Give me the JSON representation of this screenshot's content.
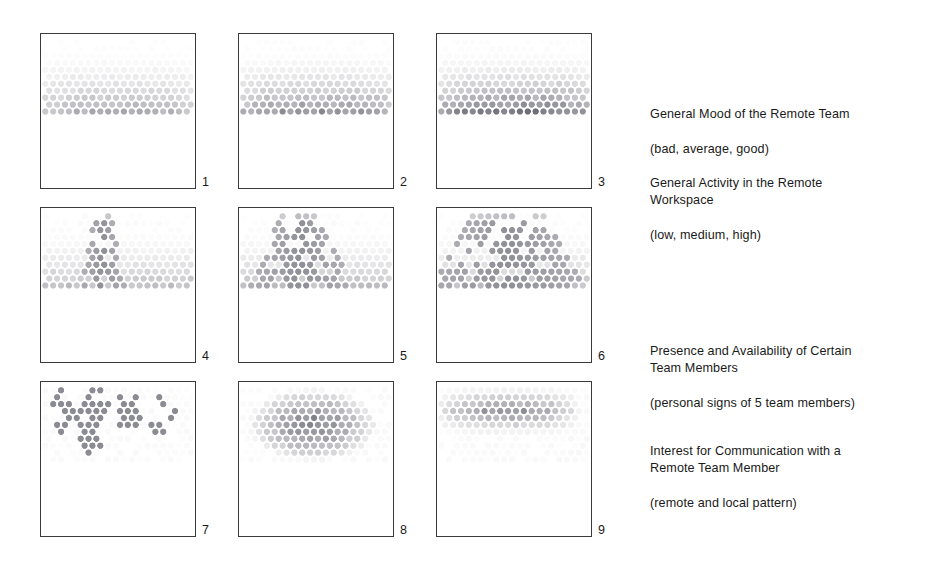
{
  "figure": {
    "background": "#ffffff",
    "ink": "#1a1a1a",
    "panel_border_color": "#3a3a3a",
    "dot_color": "#6e6e78"
  },
  "panels": [
    {
      "number": "1",
      "pattern": "gradient-band",
      "description": "General Mood of the Remote Team - bad",
      "max_alpha": 0.55,
      "band_top": 0.16,
      "band_bottom": 0.41,
      "x": 40,
      "y": 33,
      "w": 156,
      "h": 156
    },
    {
      "number": "2",
      "pattern": "gradient-band",
      "description": "General Mood of the Remote Team - average",
      "max_alpha": 0.72,
      "band_top": 0.1,
      "band_bottom": 0.44,
      "x": 238,
      "y": 33,
      "w": 156,
      "h": 156
    },
    {
      "number": "3",
      "pattern": "gradient-band",
      "description": "General Mood of the Remote Team - good",
      "max_alpha": 0.88,
      "band_top": 0.07,
      "band_bottom": 0.46,
      "x": 436,
      "y": 33,
      "w": 156,
      "h": 156
    },
    {
      "number": "4",
      "pattern": "peak-narrow",
      "description": "General Activity in the Remote Workspace - low",
      "peak_half_width": 0.055,
      "x": 40,
      "y": 207,
      "w": 156,
      "h": 156
    },
    {
      "number": "5",
      "pattern": "peak-medium",
      "description": "General Activity in the Remote Workspace - medium",
      "peak_half_width": 0.13,
      "x": 238,
      "y": 207,
      "w": 156,
      "h": 156
    },
    {
      "number": "6",
      "pattern": "peak-wide",
      "description": "General Activity in the Remote Workspace - high",
      "peak_half_width": 0.24,
      "x": 436,
      "y": 207,
      "w": 156,
      "h": 156
    },
    {
      "number": "7",
      "pattern": "personal-signs",
      "description": "Presence and Availability of Certain Team Members - personal signs of 5 team members",
      "member_count": 5,
      "x": 40,
      "y": 381,
      "w": 156,
      "h": 156
    },
    {
      "number": "8",
      "pattern": "local-blob",
      "description": "Interest for Communication - local pattern",
      "x": 238,
      "y": 381,
      "w": 156,
      "h": 156
    },
    {
      "number": "9",
      "pattern": "remote-stripe",
      "description": "Interest for Communication - remote pattern",
      "x": 436,
      "y": 381,
      "w": 156,
      "h": 156
    }
  ],
  "captions": [
    {
      "id": "caption-mood",
      "title": "General Mood of the Remote Team",
      "subtitle": "(bad, average, good)",
      "x": 650,
      "y": 88
    },
    {
      "id": "caption-activity",
      "title": "General Activity in the Remote\nWorkspace",
      "subtitle": "(low, medium, high)",
      "x": 650,
      "y": 157
    },
    {
      "id": "caption-presence",
      "title": "Presence and Availability of Certain\nTeam Members",
      "subtitle": "(personal signs of 5 team members)",
      "x": 650,
      "y": 325
    },
    {
      "id": "caption-interest",
      "title": "Interest for Communication with a\nRemote Team Member",
      "subtitle": "(remote and local pattern)",
      "x": 650,
      "y": 425
    }
  ]
}
